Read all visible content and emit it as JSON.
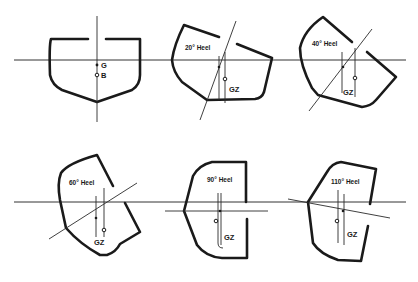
{
  "figure": {
    "colors": {
      "ink": "#1a1a1a",
      "background": "#ffffff"
    },
    "panels": [
      {
        "id": "upright",
        "label": "",
        "points": {
          "G": "G",
          "B": "B"
        }
      },
      {
        "id": "heel-20",
        "label": "20° Heel",
        "arm": "GZ"
      },
      {
        "id": "heel-40",
        "label": "40° Heel",
        "arm": "GZ"
      },
      {
        "id": "heel-60",
        "label": "60° Heel",
        "arm": "GZ"
      },
      {
        "id": "heel-90",
        "label": "90° Heel",
        "arm": "GZ"
      },
      {
        "id": "heel-110",
        "label": "110° Heel",
        "arm": "GZ"
      }
    ]
  }
}
